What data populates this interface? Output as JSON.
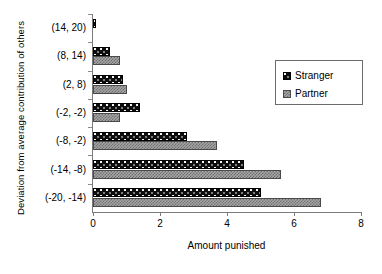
{
  "chart_data": {
    "type": "bar",
    "orientation": "horizontal",
    "title": "",
    "xlabel": "Amount punished",
    "ylabel": "Deviation from average contribution of others",
    "categories": [
      "(-20, -14)",
      "(-14, -8)",
      "(-8, -2)",
      "(-2, -2)",
      "(2, 8)",
      "(8, 14)",
      "(14, 20)"
    ],
    "series": [
      {
        "name": "Stranger",
        "values": [
          5.0,
          4.5,
          2.8,
          1.4,
          0.9,
          0.5,
          0.1
        ]
      },
      {
        "name": "Partner",
        "values": [
          6.8,
          5.6,
          3.7,
          0.8,
          1.0,
          0.8,
          0.0
        ]
      }
    ],
    "xlim": [
      0,
      8
    ],
    "xticks": [
      0,
      2,
      4,
      6,
      8
    ],
    "xtick_labels": [
      "0",
      "2",
      "4",
      "6",
      "8"
    ],
    "grid": false,
    "legend_position": "upper right",
    "legend_entries": [
      "Stranger",
      "Partner"
    ],
    "colors": {
      "stranger": "#0d0d0d",
      "partner": "#a6a6a6",
      "axis": "#7a7a7a",
      "background": "#ffffff"
    }
  },
  "axis": {
    "x_title": "Amount punished",
    "y_title": "Deviation from average contribution of others"
  },
  "legend": {
    "items": [
      {
        "label": "Stranger"
      },
      {
        "label": "Partner"
      }
    ]
  }
}
